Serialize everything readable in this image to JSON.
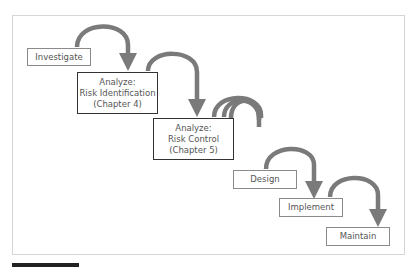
{
  "diagram": {
    "type": "waterfall",
    "colors": {
      "arrow": "#7a7a7a",
      "box_border_light": "#8a8a8a",
      "box_border_dark": "#333333",
      "text": "#555555",
      "frame_border": "#d6d6d6"
    },
    "steps": [
      {
        "id": "investigate",
        "lines": [
          "Investigate"
        ]
      },
      {
        "id": "analyze-ri",
        "lines": [
          "Analyze:",
          "Risk Identification",
          "(Chapter 4)"
        ]
      },
      {
        "id": "analyze-rc",
        "lines": [
          "Analyze:",
          "Risk Control",
          "(Chapter 5)"
        ]
      },
      {
        "id": "design",
        "lines": [
          "Design"
        ]
      },
      {
        "id": "implement",
        "lines": [
          "Implement"
        ]
      },
      {
        "id": "maintain",
        "lines": [
          "Maintain"
        ]
      }
    ]
  }
}
